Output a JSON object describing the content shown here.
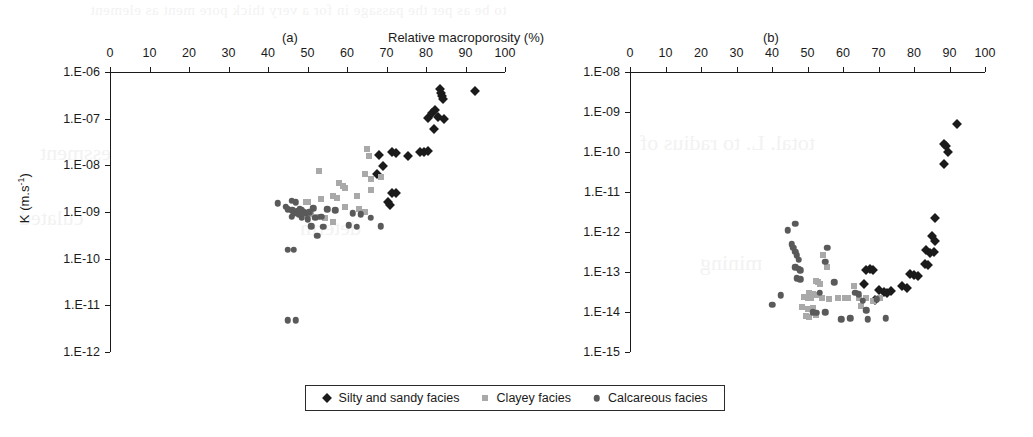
{
  "figure": {
    "axis_title": "Relative macroporosity (%)",
    "panel_a_label": "(a)",
    "panel_b_label": "(b)",
    "y_axis_label_a": "K (m.s",
    "y_axis_label_a_sup": "-1",
    "y_axis_label_a_close": ")"
  },
  "bleed_through": {
    "line_top": "to be as per the passage in for a very thick pore ment as element",
    "line_a": "essment",
    "line_b": "culated",
    "line_c": "determ",
    "line_d": "total. L. to radius of",
    "line_e": "mining"
  },
  "legend": {
    "items": [
      {
        "label": "Silty and sandy facies",
        "marker": "diamond",
        "color": "#1b1b1b"
      },
      {
        "label": "Clayey facies",
        "marker": "square",
        "color": "#a9a9a9"
      },
      {
        "label": "Calcareous facies",
        "marker": "circle",
        "color": "#5a5a5a"
      }
    ]
  },
  "chart_data": [
    {
      "type": "scatter",
      "panel": "(a)",
      "title": "(a)",
      "xlabel": "Relative macroporosity (%)",
      "ylabel": "K (m.s-1)",
      "xlim": [
        0,
        100
      ],
      "xticks": [
        0,
        10,
        20,
        30,
        40,
        50,
        60,
        70,
        80,
        90,
        100
      ],
      "yscale": "log",
      "ylim": [
        1e-12,
        1e-06
      ],
      "yticks": [
        1e-06,
        1e-07,
        1e-08,
        1e-09,
        1e-10,
        1e-11,
        1e-12
      ],
      "yticklabels": [
        "1.E-06",
        "1.E-07",
        "1.E-08",
        "1.E-09",
        "1.E-10",
        "1.E-11",
        "1.E-12"
      ],
      "grid": false,
      "legend_position": "bottom",
      "series": [
        {
          "name": "Silty and sandy facies",
          "marker": "diamond",
          "color": "#1b1b1b",
          "points": [
            [
              83.5,
              4.3e-07
            ],
            [
              83.8,
              3.6e-07
            ],
            [
              84.0,
              3.1e-07
            ],
            [
              84.3,
              2.7e-07
            ],
            [
              92.5,
              4e-07
            ],
            [
              80.5,
              1.05e-07
            ],
            [
              81.5,
              1.3e-07
            ],
            [
              82.4,
              1.5e-07
            ],
            [
              83.0,
              1.1e-07
            ],
            [
              84.5,
              1e-07
            ],
            [
              82.0,
              6e-08
            ],
            [
              68.0,
              1.7e-08
            ],
            [
              71.5,
              1.9e-08
            ],
            [
              72.5,
              1.85e-08
            ],
            [
              75.5,
              1.6e-08
            ],
            [
              78.5,
              1.9e-08
            ],
            [
              79.5,
              1.9e-08
            ],
            [
              80.5,
              2e-08
            ],
            [
              69.0,
              9.5e-09
            ],
            [
              67.5,
              6.5e-09
            ],
            [
              71.5,
              2.6e-09
            ],
            [
              72.3,
              2.5e-09
            ],
            [
              70.5,
              1.6e-09
            ],
            [
              70.8,
              1.4e-09
            ]
          ]
        },
        {
          "name": "Clayey facies",
          "marker": "square",
          "color": "#a9a9a9",
          "points": [
            [
              65.0,
              2.2e-08
            ],
            [
              65.5,
              1.6e-08
            ],
            [
              64.5,
              6.5e-09
            ],
            [
              66.0,
              5e-09
            ],
            [
              68.5,
              5.5e-09
            ],
            [
              53.0,
              7.5e-09
            ],
            [
              58.0,
              4.2e-09
            ],
            [
              59.0,
              3.6e-09
            ],
            [
              59.5,
              3.3e-09
            ],
            [
              66.0,
              3e-09
            ],
            [
              62.5,
              2.2e-09
            ],
            [
              56.5,
              2.2e-09
            ],
            [
              57.5,
              2e-09
            ],
            [
              53.5,
              1.9e-09
            ],
            [
              49.5,
              1.6e-09
            ],
            [
              50.2,
              1.6e-09
            ],
            [
              59.5,
              1.3e-09
            ],
            [
              63.0,
              1.15e-09
            ],
            [
              64.5,
              1e-09
            ],
            [
              47.0,
              1.05e-09
            ],
            [
              48.0,
              9.5e-10
            ],
            [
              51.0,
              9e-10
            ],
            [
              52.5,
              8e-10
            ],
            [
              54.5,
              7.5e-10
            ],
            [
              56.5,
              6e-10
            ]
          ]
        },
        {
          "name": "Calcareous facies",
          "marker": "circle",
          "color": "#5a5a5a",
          "points": [
            [
              42.5,
              1.55e-09
            ],
            [
              44.5,
              1.3e-09
            ],
            [
              46.0,
              1.75e-09
            ],
            [
              47.0,
              1.6e-09
            ],
            [
              45.0,
              1.15e-09
            ],
            [
              46.2,
              1.1e-09
            ],
            [
              47.5,
              1.05e-09
            ],
            [
              48.0,
              1.15e-09
            ],
            [
              48.5,
              1.1e-09
            ],
            [
              49.0,
              1e-09
            ],
            [
              46.5,
              9.5e-10
            ],
            [
              47.8,
              9e-10
            ],
            [
              49.5,
              9.5e-10
            ],
            [
              50.5,
              1e-09
            ],
            [
              51.5,
              1.2e-09
            ],
            [
              46.0,
              8e-10
            ],
            [
              48.5,
              7.5e-10
            ],
            [
              50.0,
              7e-10
            ],
            [
              52.0,
              7.5e-10
            ],
            [
              53.5,
              8e-10
            ],
            [
              55.0,
              1.15e-09
            ],
            [
              57.0,
              1.1e-09
            ],
            [
              51.0,
              5e-10
            ],
            [
              54.0,
              4.8e-10
            ],
            [
              60.5,
              5.2e-10
            ],
            [
              62.5,
              4.8e-10
            ],
            [
              66.0,
              7.5e-10
            ],
            [
              68.5,
              5e-10
            ],
            [
              61.5,
              9.5e-10
            ],
            [
              63.5,
              9e-10
            ],
            [
              52.5,
              3.1e-10
            ],
            [
              45.0,
              1.55e-10
            ],
            [
              46.5,
              1.55e-10
            ],
            [
              45.0,
              4.8e-12
            ],
            [
              47.0,
              4.8e-12
            ]
          ]
        }
      ]
    },
    {
      "type": "scatter",
      "panel": "(b)",
      "title": "(b)",
      "xlabel": "Relative macroporosity (%)",
      "ylabel": "",
      "xlim": [
        0,
        100
      ],
      "xticks": [
        0,
        10,
        20,
        30,
        40,
        50,
        60,
        70,
        80,
        90,
        100
      ],
      "yscale": "log",
      "ylim": [
        1e-15,
        1e-08
      ],
      "yticks": [
        1e-08,
        1e-09,
        1e-10,
        1e-11,
        1e-12,
        1e-13,
        1e-14,
        1e-15
      ],
      "yticklabels": [
        "1.E-08",
        "1.E-09",
        "1.E-10",
        "1.E-11",
        "1.E-12",
        "1.E-13",
        "1.E-14",
        "1.E-15"
      ],
      "grid": false,
      "legend_position": "bottom",
      "series": [
        {
          "name": "Silty and sandy facies",
          "marker": "diamond",
          "color": "#1b1b1b",
          "points": [
            [
              92.0,
              5e-10
            ],
            [
              88.5,
              1.6e-10
            ],
            [
              89.0,
              1.4e-10
            ],
            [
              89.5,
              1e-10
            ],
            [
              88.5,
              5e-11
            ],
            [
              86.0,
              2.2e-12
            ],
            [
              85.0,
              8e-13
            ],
            [
              86.0,
              6e-13
            ],
            [
              83.5,
              3.5e-13
            ],
            [
              84.5,
              3e-13
            ],
            [
              85.5,
              3.2e-13
            ],
            [
              83.0,
              1.6e-13
            ],
            [
              84.0,
              1.5e-13
            ],
            [
              79.0,
              9e-14
            ],
            [
              80.0,
              8.5e-14
            ],
            [
              81.0,
              8e-14
            ],
            [
              76.5,
              4.5e-14
            ],
            [
              78.0,
              4e-14
            ],
            [
              66.5,
              1.1e-13
            ],
            [
              67.5,
              1.2e-13
            ],
            [
              68.5,
              1.15e-13
            ],
            [
              66.0,
              5e-14
            ],
            [
              70.0,
              3.5e-14
            ],
            [
              71.5,
              3.2e-14
            ],
            [
              72.5,
              3e-14
            ],
            [
              69.0,
              2e-14
            ],
            [
              73.5,
              3.3e-14
            ]
          ]
        },
        {
          "name": "Clayey facies",
          "marker": "square",
          "color": "#a9a9a9",
          "points": [
            [
              54.5,
              2.6e-13
            ],
            [
              55.5,
              1.3e-13
            ],
            [
              52.5,
              6e-14
            ],
            [
              53.0,
              5.5e-14
            ],
            [
              53.5,
              5e-14
            ],
            [
              50.5,
              3e-14
            ],
            [
              51.5,
              2.8e-14
            ],
            [
              52.5,
              2.7e-14
            ],
            [
              49.0,
              2.4e-14
            ],
            [
              50.0,
              2.3e-14
            ],
            [
              51.0,
              2.2e-14
            ],
            [
              54.0,
              2.2e-14
            ],
            [
              56.0,
              2.1e-14
            ],
            [
              48.5,
              1.3e-14
            ],
            [
              50.0,
              1.2e-14
            ],
            [
              51.5,
              1.25e-14
            ],
            [
              49.5,
              8e-15
            ],
            [
              50.5,
              7.5e-15
            ],
            [
              52.5,
              8.5e-15
            ],
            [
              58.5,
              2.2e-14
            ],
            [
              60.5,
              2.2e-14
            ],
            [
              63.0,
              4.5e-14
            ],
            [
              64.5,
              2.3e-14
            ],
            [
              66.5,
              2.2e-14
            ],
            [
              65.0,
              1.4e-14
            ],
            [
              61.5,
              2.3e-14
            ],
            [
              68.5,
              1.9e-14
            ],
            [
              70.5,
              2.2e-14
            ]
          ]
        },
        {
          "name": "Calcareous facies",
          "marker": "circle",
          "color": "#5a5a5a",
          "points": [
            [
              44.5,
              1.1e-12
            ],
            [
              46.5,
              1.6e-12
            ],
            [
              45.5,
              5e-13
            ],
            [
              46.0,
              4e-13
            ],
            [
              46.5,
              3.2e-13
            ],
            [
              47.0,
              2.6e-13
            ],
            [
              47.5,
              2e-13
            ],
            [
              46.5,
              1.3e-13
            ],
            [
              47.5,
              1.2e-13
            ],
            [
              48.0,
              1.1e-13
            ],
            [
              47.0,
              7e-14
            ],
            [
              48.0,
              6.5e-14
            ],
            [
              42.5,
              2.6e-14
            ],
            [
              40.0,
              1.5e-14
            ],
            [
              55.5,
              4e-13
            ],
            [
              55.0,
              1.8e-13
            ],
            [
              57.5,
              5.5e-14
            ],
            [
              53.5,
              3e-14
            ],
            [
              51.5,
              1e-14
            ],
            [
              52.5,
              9.5e-15
            ],
            [
              55.0,
              1e-14
            ],
            [
              63.5,
              3e-14
            ],
            [
              64.5,
              2.8e-14
            ],
            [
              65.5,
              1.9e-14
            ],
            [
              66.5,
              1.1e-14
            ],
            [
              62.0,
              7e-15
            ],
            [
              59.5,
              6.5e-15
            ],
            [
              67.0,
              6.5e-15
            ],
            [
              72.0,
              7e-15
            ],
            [
              69.5,
              2.1e-14
            ]
          ]
        }
      ]
    }
  ]
}
